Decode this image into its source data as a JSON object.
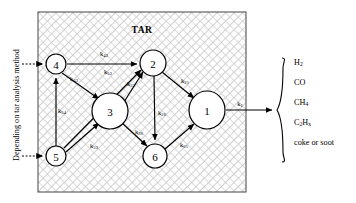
{
  "figure": {
    "box_label": "TAR",
    "left_axis_label": "Depending on tar analysis method",
    "box": {
      "x": 38,
      "y": 12,
      "width": 208,
      "height": 180
    },
    "colors": {
      "stroke": "#000000",
      "hatch": "#b8b8b8",
      "background": "#ffffff",
      "box_border": "#555555"
    }
  },
  "nodes": [
    {
      "id": "1",
      "label": "1",
      "cx": 207,
      "cy": 110,
      "rx": 18,
      "ry": 19
    },
    {
      "id": "2",
      "label": "2",
      "cx": 153,
      "cy": 63,
      "rx": 13,
      "ry": 13
    },
    {
      "id": "3",
      "label": "3",
      "cx": 110,
      "cy": 111,
      "rx": 18,
      "ry": 18
    },
    {
      "id": "4",
      "label": "4",
      "cx": 56,
      "cy": 64,
      "rx": 10,
      "ry": 10
    },
    {
      "id": "5",
      "label": "5",
      "cx": 56,
      "cy": 156,
      "rx": 10,
      "ry": 10
    },
    {
      "id": "6",
      "label": "6",
      "cx": 155,
      "cy": 156,
      "rx": 12,
      "ry": 12
    }
  ],
  "edges": [
    {
      "name": "edge-4-2",
      "base": "k",
      "sub": "42",
      "from": "4",
      "to": "2",
      "label_x": 104,
      "label_y": 53
    },
    {
      "name": "edge-4-3",
      "base": "k",
      "sub": "43",
      "from": "4",
      "to": "3",
      "label_x": 74,
      "label_y": 78
    },
    {
      "name": "edge-5-2",
      "base": "k",
      "sub": "52",
      "from": "5",
      "to": "2",
      "label_x": 108,
      "label_y": 71
    },
    {
      "name": "edge-3-2",
      "base": "k",
      "sub": "32",
      "from": "3",
      "to": "2",
      "label_x": 131,
      "label_y": 83
    },
    {
      "name": "edge-5-4",
      "base": "k",
      "sub": "54",
      "from": "5",
      "to": "4",
      "label_x": 61,
      "label_y": 110
    },
    {
      "name": "edge-5-3",
      "base": "k",
      "sub": "53",
      "from": "5",
      "to": "3",
      "label_x": 94,
      "label_y": 145
    },
    {
      "name": "edge-2-1",
      "base": "k",
      "sub": "21",
      "from": "2",
      "to": "1",
      "label_x": 185,
      "label_y": 80
    },
    {
      "name": "edge-2-6",
      "base": "k",
      "sub": "26",
      "from": "2",
      "to": "6",
      "label_x": 160,
      "label_y": 112
    },
    {
      "name": "edge-3-6",
      "base": "k",
      "sub": "36",
      "from": "3",
      "to": "6",
      "label_x": 139,
      "label_y": 131
    },
    {
      "name": "edge-6-1",
      "base": "k",
      "sub": "61",
      "from": "6",
      "to": "1",
      "label_x": 184,
      "label_y": 144
    },
    {
      "name": "edge-1-products",
      "base": "k",
      "sub": "1",
      "from": "1",
      "to": "products",
      "label_x": 240,
      "label_y": 103
    }
  ],
  "inputs": [
    {
      "name": "input-arrow-node4",
      "target": "4",
      "y": 64
    },
    {
      "name": "input-arrow-node5",
      "target": "5",
      "y": 156
    }
  ],
  "products": {
    "items": [
      {
        "text": "H",
        "sub": "2"
      },
      {
        "text": "CO",
        "sub": ""
      },
      {
        "text": "CH",
        "sub": "4"
      },
      {
        "text": "C",
        "sub": "2",
        "text2": "H",
        "sub2": "x"
      },
      {
        "text": "coke or soot",
        "sub": ""
      }
    ],
    "x": 294,
    "start_y": 62,
    "line_height": 20
  }
}
